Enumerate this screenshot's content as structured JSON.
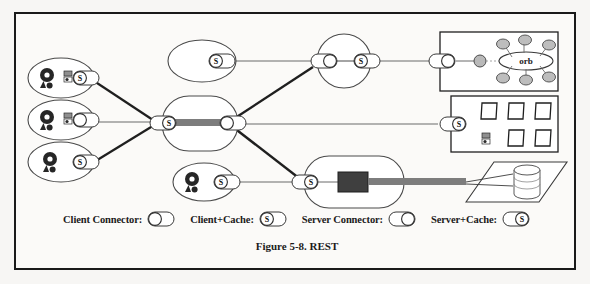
{
  "figure": {
    "caption": "Figure 5-8. REST",
    "border_color": "#1a1a1a",
    "background_color": "#fbfaf8",
    "line_color": "#3a3a3a",
    "thick_link_color": "#6e6e6e",
    "fill_gray": "#b9b9b9",
    "fill_dark": "#3a3a3a"
  },
  "legend": {
    "items": [
      {
        "label": "Client Connector:",
        "icon": "client-connector-icon",
        "cache": false,
        "side": "left"
      },
      {
        "label": "Client+Cache:",
        "icon": "client-cache-icon",
        "cache": true,
        "side": "left"
      },
      {
        "label": "Server Connector:",
        "icon": "server-connector-icon",
        "cache": false,
        "side": "right"
      },
      {
        "label": "Server+Cache:",
        "icon": "server-cache-icon",
        "cache": true,
        "side": "right"
      }
    ]
  },
  "diagram": {
    "nodes": [
      {
        "id": "client-1",
        "type": "user-agent-ellipse",
        "connector": "client-cache",
        "has_secondary_glyph": true,
        "label": ""
      },
      {
        "id": "client-2",
        "type": "user-agent-ellipse",
        "connector": "client-connector",
        "has_secondary_glyph": true,
        "label": ""
      },
      {
        "id": "client-3",
        "type": "user-agent-ellipse",
        "connector": "client-cache",
        "has_secondary_glyph": false,
        "label": ""
      },
      {
        "id": "client-4",
        "type": "user-agent-ellipse",
        "connector": "client-cache",
        "has_secondary_glyph": false,
        "label": ""
      },
      {
        "id": "proxy-top",
        "type": "empty-ellipse",
        "connector": "client-cache",
        "label": ""
      },
      {
        "id": "gateway-center",
        "type": "stadium",
        "connector_left": "server-cache",
        "connector_right": "client-connector",
        "label": ""
      },
      {
        "id": "gateway-top",
        "type": "circle",
        "connector_left": "server-connector",
        "connector_right": "client-cache",
        "label": ""
      },
      {
        "id": "origin-server-top",
        "type": "box-orb",
        "connector": "server-connector",
        "label": "orb"
      },
      {
        "id": "origin-server-mid",
        "type": "box-documents",
        "connector": "server-cache",
        "document_count": 5,
        "label": ""
      },
      {
        "id": "origin-server-bottom",
        "type": "stadium-process",
        "connector": "server-cache",
        "label": ""
      },
      {
        "id": "database",
        "type": "cylinder-on-plane",
        "label": ""
      }
    ],
    "connector_symbol": "S",
    "orb_label": "orb",
    "orb_satellite_count": 6
  }
}
